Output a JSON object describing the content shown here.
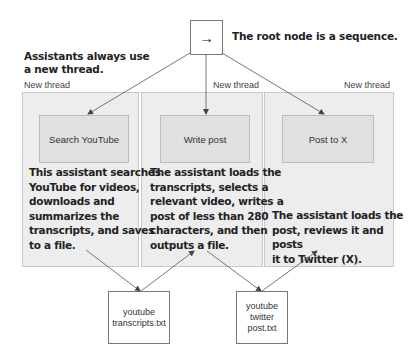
{
  "root": {
    "symbol": "→",
    "icon": "sequence-arrow-icon",
    "annotation": "The root node is a sequence."
  },
  "side_note": {
    "line1": "Assistants always use",
    "line2": "a new thread."
  },
  "threads": [
    {
      "label": "New thread",
      "task": "Search YouTube",
      "description": [
        "This assistant searches",
        "YouTube for videos,",
        "downloads and",
        "summarizes the",
        "transcripts, and saves",
        "to a file."
      ]
    },
    {
      "label": "New thread",
      "task": "Write post",
      "description": [
        "The assistant loads the",
        "transcripts, selects a",
        "relevant video, writes a",
        "post of less than 280",
        "characters, and then",
        "outputs a file."
      ]
    },
    {
      "label": "New thread",
      "task": "Post to X",
      "description": [
        "The assistant loads the",
        "post, reviews it and posts",
        "it to Twitter (X)."
      ]
    }
  ],
  "files": [
    {
      "lines": [
        "youtube",
        "transcripts.txt"
      ]
    },
    {
      "lines": [
        "youtube",
        "twitter",
        "post.txt"
      ]
    }
  ],
  "colors": {
    "panel_bg": "#ededed",
    "task_bg": "#e0e0e0",
    "line": "#555555",
    "text": "#222222"
  }
}
